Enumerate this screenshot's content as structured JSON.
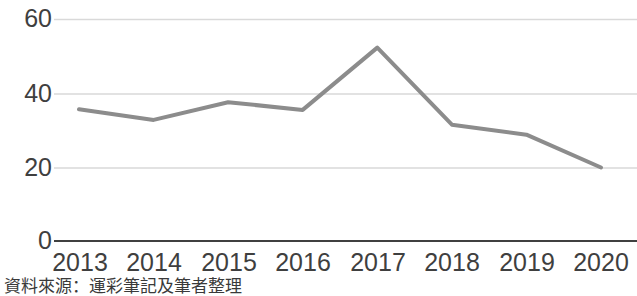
{
  "chart_data": {
    "type": "line",
    "title": "",
    "subtitle": "",
    "xlabel": "",
    "ylabel": "",
    "categories": [
      "2013",
      "2014",
      "2015",
      "2016",
      "2017",
      "2018",
      "2019",
      "2020"
    ],
    "x": [
      2013,
      2014,
      2015,
      2016,
      2017,
      2018,
      2019,
      2020
    ],
    "values": [
      35.7,
      32.8,
      37.6,
      35.5,
      52.4,
      31.5,
      28.8,
      19.9
    ],
    "series": [
      {
        "name": "",
        "values": [
          35.7,
          32.8,
          37.6,
          35.5,
          52.4,
          31.5,
          28.8,
          19.9
        ],
        "color": "#8c8c8c",
        "line_width": 4,
        "markers": false
      }
    ],
    "ylim": [
      0,
      60
    ],
    "yticks": [
      0,
      20,
      40,
      60
    ],
    "ytick_labels": [
      "0",
      "20",
      "40",
      "60"
    ],
    "grid": true,
    "grid_axis": "y",
    "grid_color": "#d9d9d9",
    "axis_line_color": "#404040",
    "legend": false,
    "legend_position": "none",
    "annotations": []
  },
  "axes": {
    "y_ticks": [
      {
        "label": "60",
        "value": 60
      },
      {
        "label": "40",
        "value": 40
      },
      {
        "label": "20",
        "value": 20
      },
      {
        "label": "0",
        "value": 0
      }
    ],
    "x_ticks": [
      {
        "label": "2013"
      },
      {
        "label": "2014"
      },
      {
        "label": "2015"
      },
      {
        "label": "2016"
      },
      {
        "label": "2017"
      },
      {
        "label": "2018"
      },
      {
        "label": "2019"
      },
      {
        "label": "2020"
      }
    ]
  },
  "footer": {
    "source_note": "資料來源：運彩筆記及筆者整理"
  },
  "colors": {
    "line": "#8c8c8c",
    "grid": "#d9d9d9",
    "axis": "#404040",
    "text": "#3f3f3f",
    "background": "#ffffff"
  }
}
